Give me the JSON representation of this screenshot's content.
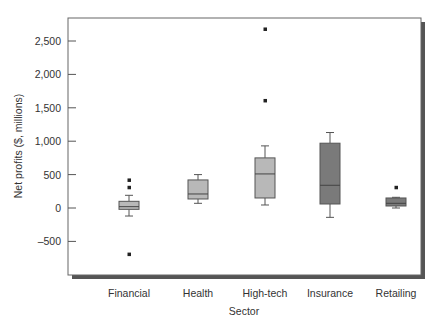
{
  "chart_data": {
    "type": "boxplot",
    "title": "",
    "xlabel": "Sector",
    "ylabel": "Net profits ($, millions)",
    "ylim": [
      -1000,
      2750
    ],
    "yticks": [
      2500,
      2000,
      1500,
      1000,
      500,
      0,
      -500
    ],
    "ytick_labels": [
      "2,500",
      "2,000",
      "1,500",
      "1,000",
      "500",
      "0",
      "–500"
    ],
    "grid": false,
    "legend": null,
    "categories": [
      "Financial",
      "Health",
      "High-tech",
      "Insurance",
      "Retailing"
    ],
    "series": [
      {
        "name": "Financial",
        "whisker_low": -120,
        "q1": -20,
        "median": 20,
        "q3": 100,
        "whisker_high": 190,
        "outliers": [
          420,
          310,
          -690
        ],
        "fill": "#b8b8b8"
      },
      {
        "name": "Health",
        "whisker_low": 70,
        "q1": 135,
        "median": 210,
        "q3": 420,
        "whisker_high": 500,
        "outliers": [],
        "fill": "#b8b8b8"
      },
      {
        "name": "High-tech",
        "whisker_low": 45,
        "q1": 150,
        "median": 510,
        "q3": 750,
        "whisker_high": 930,
        "outliers": [
          2680,
          1610
        ],
        "fill": "#b8b8b8"
      },
      {
        "name": "Insurance",
        "whisker_low": -140,
        "q1": 60,
        "median": 340,
        "q3": 970,
        "whisker_high": 1130,
        "outliers": [],
        "fill": "#7a7a7a"
      },
      {
        "name": "Retailing",
        "whisker_low": 0,
        "q1": 30,
        "median": 70,
        "q3": 150,
        "whisker_high": 160,
        "outliers": [
          310
        ],
        "fill": "#7a7a7a"
      }
    ]
  }
}
